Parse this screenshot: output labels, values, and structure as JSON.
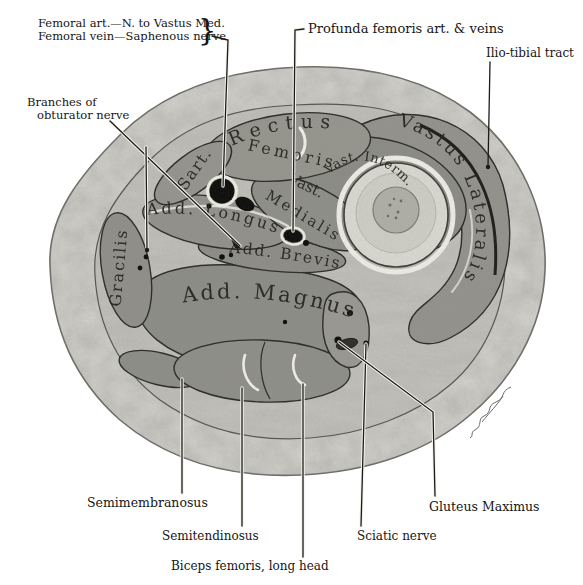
{
  "figure": {
    "type": "anatomical-cross-section-of-thigh",
    "annotations": {
      "femoral_line1": "Femoral art.—N. to Vastus Med.",
      "femoral_line2": "Femoral vein—Saphenous nerve",
      "brace": "}",
      "profunda": "Profunda femoris art. & veins",
      "iliotibial": "Ilio-tibial tract",
      "obturator_line1": "Branches of",
      "obturator_line2": "obturator nerve",
      "semimembranosus": "Semimembranosus",
      "semitendinosus": "Semitendinosus",
      "biceps_femoris": "Biceps femoris, long head",
      "sciatic": "Sciatic nerve",
      "gluteus": "Gluteus Maximus"
    },
    "muscle_labels": {
      "sartorius": "Sart.",
      "rectus_femoris_1": "Rectus",
      "rectus_femoris_2": "Femoris",
      "vastus_medialis_1": "Vast.",
      "vastus_medialis_2": "Medialis",
      "vastus_intermedius": "Vast. Interm.",
      "vastus_lateralis": "Vastus Lateralis",
      "adductor_longus": "Add. Longus",
      "adductor_brevis": "Add. Brevis",
      "adductor_magnus": "Add. Magnus",
      "gracilis": "Gracilis"
    },
    "colors": {
      "background": "#ffffff",
      "subcutaneous_fat": "#d7d6d1",
      "inner_fascia_bed": "#c6c5bf",
      "muscle_grey": "#95958e",
      "bone_cortex": "#dbdad2",
      "bone_marrow": "#b1b0a8",
      "vessel_black": "#0d0d0b",
      "outline_dark": "#2c2c28",
      "label_ink": "#161613"
    }
  }
}
